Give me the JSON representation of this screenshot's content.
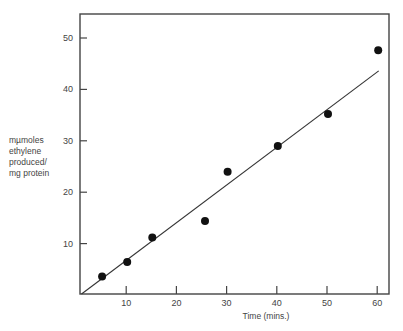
{
  "chart_data": {
    "type": "scatter",
    "title": "",
    "xlabel": "Time (mins.)",
    "ylabel": [
      "mµmoles",
      "ethylene",
      "produced/",
      "mg protein"
    ],
    "xlim": [
      0,
      62
    ],
    "ylim": [
      0,
      55
    ],
    "x_ticks": [
      10,
      20,
      30,
      40,
      50,
      60
    ],
    "y_ticks": [
      10,
      20,
      30,
      40,
      50
    ],
    "grid": false,
    "legend": null,
    "series": [
      {
        "name": "measured",
        "type": "scatter",
        "x": [
          5,
          10,
          15,
          25.5,
          30,
          40,
          50,
          60
        ],
        "y": [
          3.6,
          6.4,
          11.2,
          14.4,
          24.0,
          29.0,
          35.2,
          47.6
        ]
      },
      {
        "name": "fitted line",
        "type": "line",
        "x": [
          0.3,
          60.3
        ],
        "y": [
          0,
          43.6
        ]
      }
    ]
  },
  "colors": {
    "axis": "#444444",
    "points": "#111111",
    "line": "#333333"
  }
}
